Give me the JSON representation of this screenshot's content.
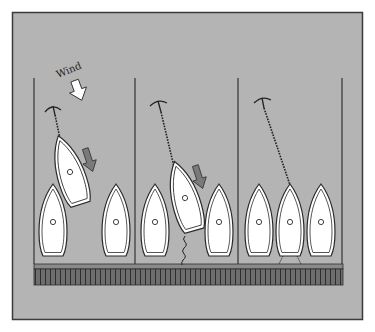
{
  "diagram": {
    "wind_label": "Wind",
    "colors": {
      "background": "#b4b4b4",
      "frame": "#3a3a3a",
      "pile_line": "#333333",
      "dock_fill": "#6e6e6e",
      "dock_top": "#8a8a8a",
      "dock_slats": "#333333",
      "hull_fill": "#ffffff",
      "hull_outline": "#2a2a2a",
      "motion_arrow": "#7a7a7a",
      "wind_arrow": "#ffffff"
    },
    "panels": [
      {
        "name": "panel-1",
        "caption": "Boat drifting downwind, anchor line slack",
        "boats": [
          {
            "name": "moored-boat-left",
            "cx": 53,
            "cy": 222,
            "angle": 0
          },
          {
            "name": "drifting-boat",
            "cx": 69,
            "cy": 170,
            "angle": -18
          },
          {
            "name": "moored-boat-right",
            "cx": 116,
            "cy": 222,
            "angle": 0
          }
        ]
      },
      {
        "name": "panel-2",
        "caption": "Boat swinging into berth, stern line attached",
        "boats": [
          {
            "name": "moored-boat-left",
            "cx": 155,
            "cy": 222,
            "angle": 0
          },
          {
            "name": "entering-boat",
            "cx": 185,
            "cy": 195,
            "angle": -16
          },
          {
            "name": "moored-boat-right",
            "cx": 218,
            "cy": 222,
            "angle": 0
          }
        ]
      },
      {
        "name": "panel-3",
        "caption": "Boat secured in berth between neighbours",
        "boats": [
          {
            "name": "moored-boat-left",
            "cx": 258,
            "cy": 222,
            "angle": 0
          },
          {
            "name": "berthed-boat",
            "cx": 290,
            "cy": 222,
            "angle": 0
          },
          {
            "name": "moored-boat-right",
            "cx": 320,
            "cy": 222,
            "angle": 0
          }
        ]
      }
    ]
  }
}
